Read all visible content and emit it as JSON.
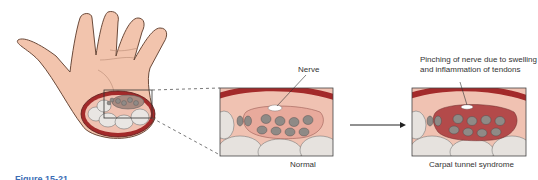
{
  "labels": {
    "nerve": "Nerve",
    "pinching": "Pinching of nerve due to swelling and inflammation of tendons",
    "normal": "Normal",
    "cts": "Carpal tunnel syndrome"
  },
  "caption": "Figure 15-21",
  "colors": {
    "skin": "#f2c4ad",
    "ligament": "#a32a2a",
    "tissue": "#f0c2b2",
    "tendon": "#8f8a86",
    "bone": "#e6e2de",
    "inflamed": "#b34a4a"
  }
}
